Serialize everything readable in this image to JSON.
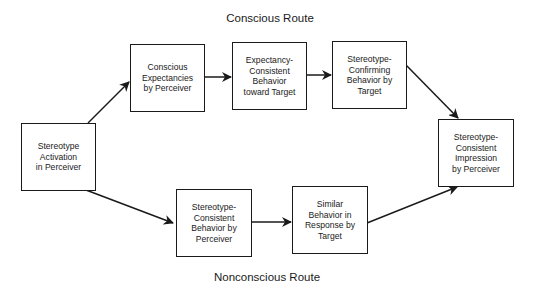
{
  "labels": {
    "conscious_route": "Conscious Route",
    "nonconscious_route": "Nonconscious Route"
  },
  "nodes": {
    "activation": "Stereotype\nActivation\nin Perceiver",
    "conscious_expectancies": "Conscious\nExpectancies\nby Perceiver",
    "expectancy_consistent": "Expectancy-\nConsistent\nBehavior\ntoward Target",
    "stereotype_confirming": "Stereotype-\nConfirming\nBehavior by\nTarget",
    "impression": "Stereotype-\nConsistent\nImpression\nby Perceiver",
    "consistent_behavior": "Stereotype-\nConsistent\nBehavior by\nPerceiver",
    "similar_behavior": "Similar\nBehavior in\nResponse by\nTarget"
  },
  "edges": [
    {
      "from": "activation",
      "to": "conscious_expectancies"
    },
    {
      "from": "conscious_expectancies",
      "to": "expectancy_consistent"
    },
    {
      "from": "expectancy_consistent",
      "to": "stereotype_confirming"
    },
    {
      "from": "stereotype_confirming",
      "to": "impression"
    },
    {
      "from": "activation",
      "to": "consistent_behavior"
    },
    {
      "from": "consistent_behavior",
      "to": "similar_behavior"
    },
    {
      "from": "similar_behavior",
      "to": "impression"
    }
  ]
}
